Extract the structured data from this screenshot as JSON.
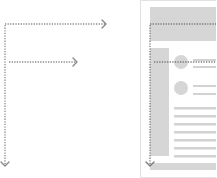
{
  "diagram": {
    "type": "f-pattern-reading-illustration",
    "colors": {
      "arrow": "#8a8a8a",
      "block": "#d4d4d4",
      "line": "#d0d0d0",
      "frame": "#e6e6e6",
      "background": "#ffffff"
    },
    "left_panel": {
      "arrows": [
        {
          "direction": "right",
          "y": 24,
          "x1": 5,
          "x2": 106
        },
        {
          "direction": "right",
          "y": 62,
          "x1": 8,
          "x2": 77
        },
        {
          "direction": "down",
          "x": 5,
          "y1": 24,
          "y2": 166
        }
      ]
    },
    "right_panel": {
      "frame": {
        "x": 140,
        "y": 1,
        "w": 75,
        "h": 177
      },
      "header_band": {
        "x": 150,
        "y": 7,
        "w": 66,
        "h": 34
      },
      "sidebar": {
        "x": 150,
        "y": 48,
        "w": 19,
        "h": 108
      },
      "avatars": [
        {
          "cx": 180,
          "cy": 62,
          "r": 7
        },
        {
          "cx": 180,
          "cy": 88,
          "r": 7
        }
      ],
      "text_lines_count": 9,
      "footer_band": {
        "x": 150,
        "y": 163,
        "w": 66,
        "h": 7
      }
    }
  }
}
